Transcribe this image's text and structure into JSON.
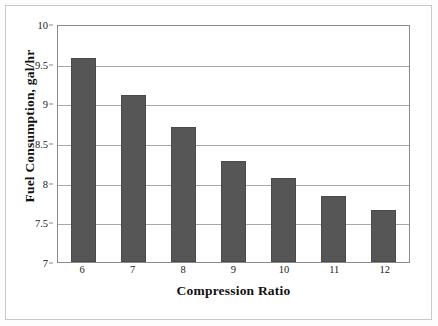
{
  "chart_data": {
    "type": "bar",
    "title": "",
    "xlabel": "Compression Ratio",
    "ylabel": "Fuel Consumption, gal/hr",
    "categories": [
      "6",
      "7",
      "8",
      "9",
      "10",
      "11",
      "12"
    ],
    "values": [
      9.57,
      9.1,
      8.7,
      8.27,
      8.06,
      7.83,
      7.65
    ],
    "ylim": [
      7,
      10
    ],
    "yticks": [
      "7",
      "7.5",
      "8",
      "8.5",
      "9",
      "9.5",
      "10"
    ],
    "ytick_values": [
      7,
      7.5,
      8,
      8.5,
      9,
      9.5,
      10
    ],
    "grid": "horizontal",
    "legend": "none",
    "series": [
      {
        "name": "Fuel Consumption",
        "values": [
          9.57,
          9.1,
          8.7,
          8.27,
          8.06,
          7.83,
          7.65
        ]
      }
    ]
  },
  "style": {
    "bar_color": "#565656",
    "bar_border_color": "#4a4a4a",
    "gridline_color": "#a8a8a8",
    "axis_color": "#8a8a8a",
    "frame_color": "#c9c9c9",
    "background": "#ffffff",
    "text_color": "#111111"
  }
}
